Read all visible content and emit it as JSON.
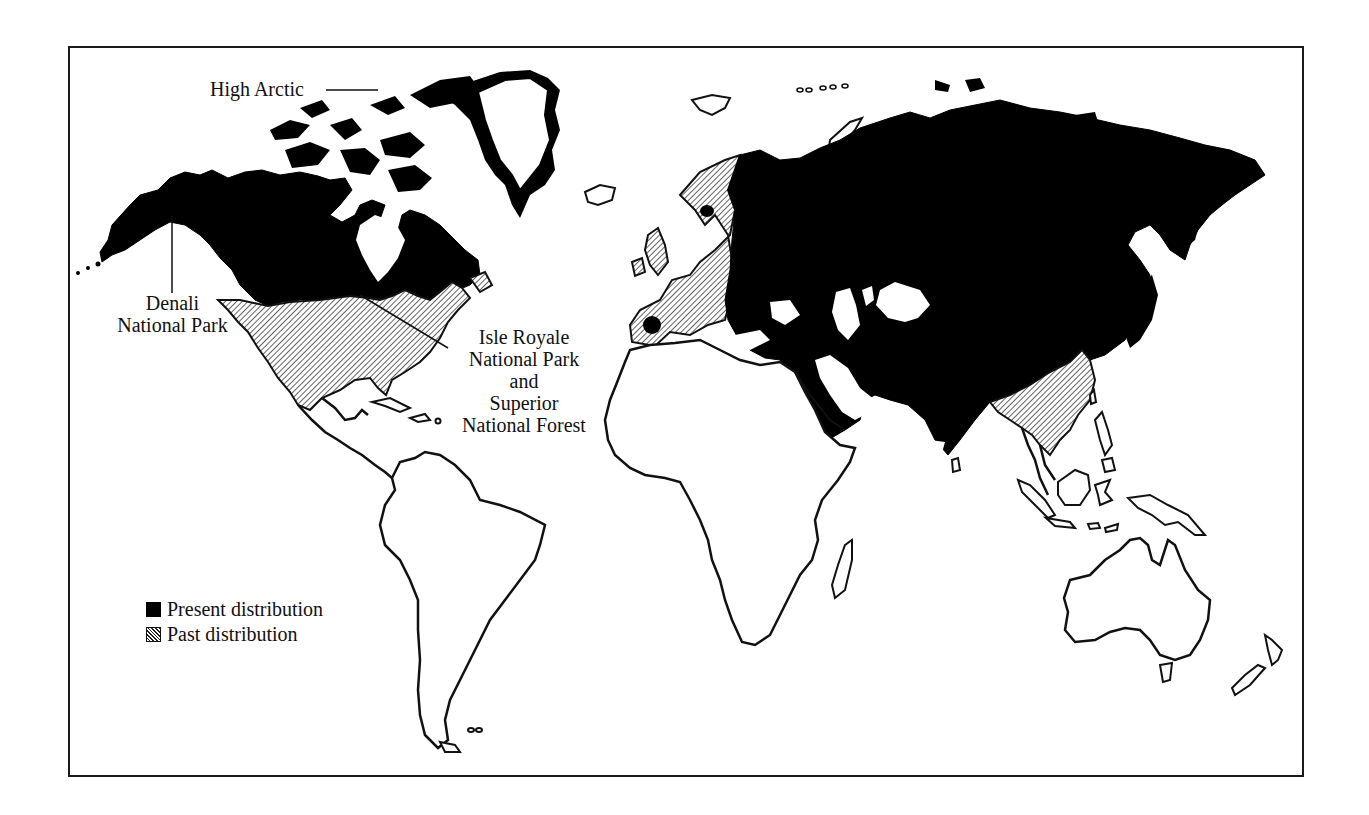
{
  "map": {
    "labels": {
      "high_arctic": "High Arctic",
      "denali_line1": "Denali",
      "denali_line2": "National Park",
      "isle_line1": "Isle Royale",
      "isle_line2": "National Park",
      "isle_line3": "and",
      "isle_line4": "Superior",
      "isle_line5": "National Forest"
    },
    "legend": {
      "items": [
        {
          "label": "Present distribution",
          "style": "solid-black"
        },
        {
          "label": "Past distribution",
          "style": "diagonal-hatch"
        }
      ]
    },
    "colors": {
      "present": "#000000",
      "past_hatch": "#222222",
      "outline": "#111111",
      "background": "#ffffff"
    }
  }
}
